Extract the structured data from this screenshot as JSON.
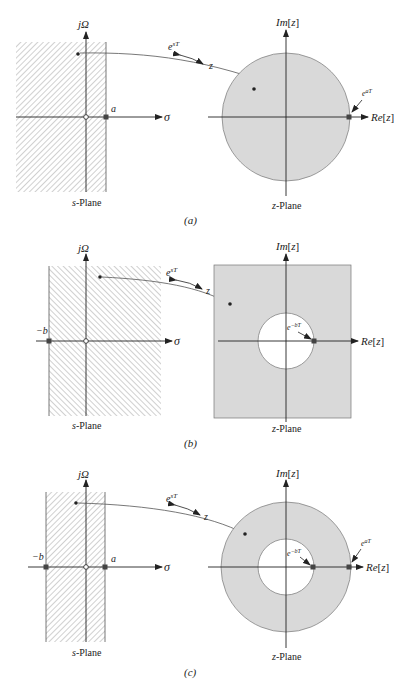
{
  "panels": [
    {
      "caption": "(a)",
      "s_plane": {
        "title": "s-Plane",
        "title_italic": "s",
        "title_rest": "-Plane",
        "vertical_axis": "jΩ",
        "horizontal_axis": "σ",
        "markers": [
          {
            "label": "a",
            "type": "cross"
          }
        ],
        "region": "Re[s] < a (hatched half-plane)"
      },
      "mapping": {
        "forward": "e",
        "forward_sup": "sT",
        "target": "z"
      },
      "z_plane": {
        "title": "z-Plane",
        "title_italic": "z",
        "title_rest": "-Plane",
        "vertical_axis": "Im[z]",
        "vertical_axis_italic": "Im",
        "horizontal_axis": "Re[z]",
        "horizontal_axis_italic": "Re",
        "markers": [
          {
            "label": "e",
            "sup": "aT",
            "type": "cross"
          }
        ],
        "region": "|z| < e^{aT} (shaded disk)"
      }
    },
    {
      "caption": "(b)",
      "s_plane": {
        "title": "s-Plane",
        "title_italic": "s",
        "title_rest": "-Plane",
        "vertical_axis": "jΩ",
        "horizontal_axis": "σ",
        "markers": [
          {
            "label": "−b",
            "type": "cross"
          }
        ],
        "region": "Re[s] > −b (hatched half-plane)"
      },
      "mapping": {
        "forward": "e",
        "forward_sup": "sT",
        "target": "z"
      },
      "z_plane": {
        "title": "z-Plane",
        "title_italic": "z",
        "title_rest": "-Plane",
        "vertical_axis": "Im[z]",
        "vertical_axis_italic": "Im",
        "horizontal_axis": "Re[z]",
        "horizontal_axis_italic": "Re",
        "markers": [
          {
            "label": "e",
            "sup": "−bT",
            "type": "cross"
          }
        ],
        "region": "|z| > e^{−bT} (shaded exterior of disk)"
      }
    },
    {
      "caption": "(c)",
      "s_plane": {
        "title": "s-Plane",
        "title_italic": "s",
        "title_rest": "-Plane",
        "vertical_axis": "jΩ",
        "horizontal_axis": "σ",
        "markers": [
          {
            "label": "−b",
            "type": "cross"
          },
          {
            "label": "a",
            "type": "cross"
          }
        ],
        "region": "−b < Re[s] < a (hatched strip)"
      },
      "mapping": {
        "forward": "e",
        "forward_sup": "sT",
        "target": "z"
      },
      "z_plane": {
        "title": "z-Plane",
        "title_italic": "z",
        "title_rest": "-Plane",
        "vertical_axis": "Im[z]",
        "vertical_axis_italic": "Im",
        "horizontal_axis": "Re[z]",
        "horizontal_axis_italic": "Re",
        "markers": [
          {
            "label": "e",
            "sup": "−bT",
            "type": "cross"
          },
          {
            "label": "e",
            "sup": "aT",
            "type": "cross"
          }
        ],
        "region": "e^{−bT} < |z| < e^{aT} (shaded annulus)"
      }
    }
  ],
  "colors": {
    "ink": "#222222",
    "shade": "#d9d9d9",
    "hatch": "#8a8a8a",
    "background": "#ffffff"
  }
}
